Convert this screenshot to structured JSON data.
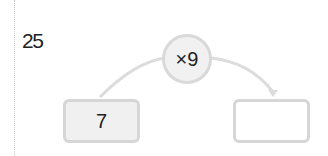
{
  "problem": {
    "number": "25"
  },
  "diagram": {
    "operator": "×9",
    "input_value": "7",
    "output_value": "",
    "colors": {
      "stroke": "#d9d9d9",
      "circle_fill": "#f1f1f1",
      "input_fill": "#f0f0f0",
      "output_fill": "#ffffff"
    }
  }
}
